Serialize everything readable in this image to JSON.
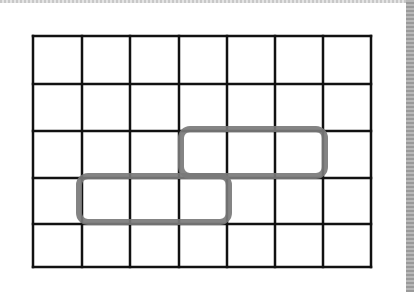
{
  "figure": {
    "type": "grid-with-highlighted-regions",
    "grid": {
      "columns": 7,
      "rows": 5,
      "x_lines": [
        33,
        82,
        130,
        179,
        227,
        275,
        323,
        371
      ],
      "y_lines": [
        36,
        84,
        131,
        178,
        224,
        267
      ],
      "line_color": "#111111",
      "line_width": 2.5
    },
    "highlights": [
      {
        "name": "upper-region",
        "description": "3 cells, row 3 (from top), columns 4-6",
        "x": 181,
        "y": 129,
        "width": 144,
        "height": 47,
        "stroke": "#7a7a7a"
      },
      {
        "name": "lower-region",
        "description": "3 cells, row 4 (from top), columns 2-4",
        "x": 79,
        "y": 176,
        "width": 150,
        "height": 46,
        "stroke": "#7a7a7a"
      }
    ],
    "background": "#ffffff"
  }
}
